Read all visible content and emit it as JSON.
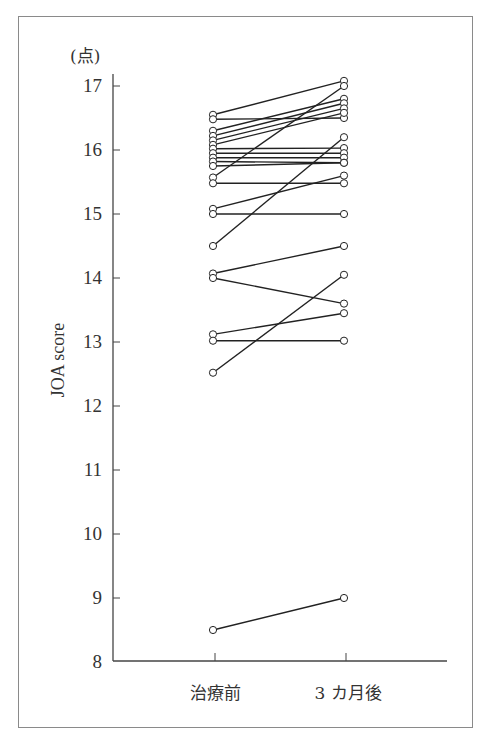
{
  "chart_data": {
    "type": "line",
    "subtype": "paired-slope",
    "title": "",
    "xlabel": "",
    "ylabel": "JOA score",
    "y_unit": "(点)",
    "categories": [
      "治療前",
      "3 カ月後"
    ],
    "yticks": [
      8,
      9,
      10,
      11,
      12,
      13,
      14,
      15,
      16,
      17
    ],
    "ylim": [
      8,
      17
    ],
    "grid": false,
    "legend": null,
    "marker": "open-circle",
    "pairs": [
      {
        "before": 16.55,
        "after": 17.08
      },
      {
        "before": 16.48,
        "after": 16.5
      },
      {
        "before": 16.3,
        "after": 16.8
      },
      {
        "before": 16.22,
        "after": 16.73
      },
      {
        "before": 16.15,
        "after": 16.65
      },
      {
        "before": 16.08,
        "after": 16.58
      },
      {
        "before": 16.02,
        "after": 16.03
      },
      {
        "before": 15.95,
        "after": 15.95
      },
      {
        "before": 15.88,
        "after": 15.88
      },
      {
        "before": 15.82,
        "after": 15.8
      },
      {
        "before": 15.75,
        "after": 15.8
      },
      {
        "before": 15.57,
        "after": 17.0
      },
      {
        "before": 15.48,
        "after": 15.48
      },
      {
        "before": 15.08,
        "after": 15.6
      },
      {
        "before": 15.0,
        "after": 15.0
      },
      {
        "before": 14.5,
        "after": 16.2
      },
      {
        "before": 14.07,
        "after": 14.5
      },
      {
        "before": 14.0,
        "after": 13.6
      },
      {
        "before": 13.12,
        "after": 13.45
      },
      {
        "before": 13.02,
        "after": 13.02
      },
      {
        "before": 12.52,
        "after": 14.05
      },
      {
        "before": 8.5,
        "after": 9.0
      }
    ]
  },
  "colors": {
    "line": "#222222",
    "axis": "#444444",
    "frame": "#8a8a8a",
    "marker_fill": "#ffffff"
  }
}
